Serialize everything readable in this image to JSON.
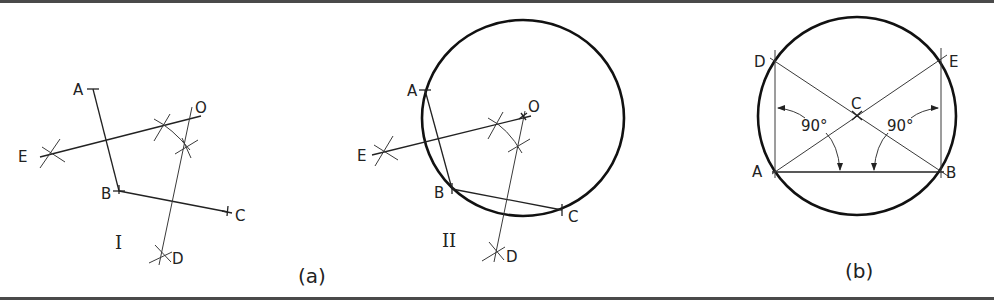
{
  "figure": {
    "panels": [
      {
        "id": "a-I",
        "caption": "(a)",
        "step": "I",
        "points": {
          "A": {
            "label": "A",
            "x": 93,
            "y": 89
          },
          "B": {
            "label": "B",
            "x": 119,
            "y": 191
          },
          "C": {
            "label": "C",
            "x": 228,
            "y": 212
          },
          "D": {
            "label": "D",
            "x": 162,
            "y": 256
          },
          "E": {
            "label": "E",
            "x": 49,
            "y": 154
          },
          "O": {
            "label": "O",
            "x": 192,
            "y": 118
          }
        }
      },
      {
        "id": "a-II",
        "step": "II",
        "points": {
          "A": {
            "label": "A",
            "x": 425,
            "y": 90
          },
          "B": {
            "label": "B",
            "x": 452,
            "y": 189
          },
          "C": {
            "label": "C",
            "x": 562,
            "y": 210
          },
          "D": {
            "label": "D",
            "x": 496,
            "y": 253
          },
          "E": {
            "label": "E",
            "x": 381,
            "y": 152
          },
          "O": {
            "label": "O",
            "x": 523,
            "y": 118
          }
        },
        "circle": {
          "cx": 523,
          "cy": 118,
          "rx": 101,
          "ry": 98
        }
      },
      {
        "id": "b",
        "caption": "(b)",
        "points": {
          "A": {
            "label": "A",
            "x": 775,
            "y": 172
          },
          "B": {
            "label": "B",
            "x": 941,
            "y": 172
          },
          "C": {
            "label": "C",
            "x": 857,
            "y": 116
          },
          "D": {
            "label": "D",
            "x": 773,
            "y": 62
          },
          "E": {
            "label": "E",
            "x": 941,
            "y": 59
          }
        },
        "angles": [
          {
            "label": "90°",
            "at": "A"
          },
          {
            "label": "90°",
            "at": "B"
          }
        ],
        "circle": {
          "cx": 857,
          "cy": 116,
          "r": 100
        }
      }
    ]
  }
}
